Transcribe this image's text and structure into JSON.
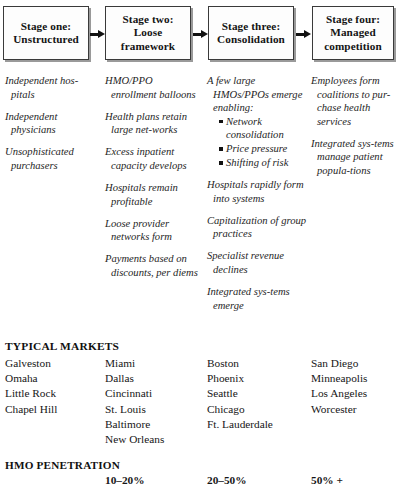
{
  "stages": [
    {
      "id": "stage-one",
      "label": "Stage one:\nUnstructured"
    },
    {
      "id": "stage-two",
      "label": "Stage two:\nLoose\nframework"
    },
    {
      "id": "stage-three",
      "label": "Stage three:\nConsolidation"
    },
    {
      "id": "stage-four",
      "label": "Stage four:\nManaged\ncompetition"
    }
  ],
  "columns": [
    {
      "id": "column-stage-one",
      "items": [
        "Independent hos-pitals",
        "Independent physicians",
        "Unsophisticated purchasers"
      ]
    },
    {
      "id": "column-stage-two",
      "items": [
        "HMO/PPO enrollment balloons",
        "Health plans retain large net-works",
        "Excess inpatient capacity develops",
        "Hospitals remain profitable",
        "Loose provider networks form",
        "Payments based on discounts, per diems"
      ]
    },
    {
      "id": "column-stage-three",
      "items": [
        "A few large HMOs/PPOs emerge enabling:",
        "Hospitals rapidly form into systems",
        "Capitalization of group practices",
        "Specialist revenue declines",
        "Integrated sys-tems emerge"
      ],
      "sub_bullets": [
        "Network consolidation",
        "Price pressure",
        "Shifting of risk"
      ]
    },
    {
      "id": "column-stage-four",
      "items": [
        "Employees form coalitions to pur-chase health services",
        "Integrated sys-tems manage patient popula-tions"
      ]
    }
  ],
  "typical_markets": {
    "heading": "TYPICAL MARKETS",
    "columns": [
      {
        "id": "markets-stage-one",
        "cities": [
          "Galveston",
          "Omaha",
          "Little Rock",
          "Chapel Hill"
        ]
      },
      {
        "id": "markets-stage-two",
        "cities": [
          "Miami",
          "Dallas",
          "Cincinnati",
          "St. Louis",
          "Baltimore",
          "New Orleans"
        ]
      },
      {
        "id": "markets-stage-three",
        "cities": [
          "Boston",
          "Phoenix",
          "Seattle",
          "Chicago",
          "Ft. Lauderdale"
        ]
      },
      {
        "id": "markets-stage-four",
        "cities": [
          "San Diego",
          "Minneapolis",
          "Los Angeles",
          "Worcester"
        ]
      }
    ]
  },
  "hmo_penetration": {
    "heading": "HMO PENETRATION",
    "values": [
      "",
      "10–20%",
      "20–50%",
      "50% +"
    ]
  },
  "arrows": [
    "arrow-stage-one-to-two",
    "arrow-stage-two-to-three",
    "arrow-stage-three-to-four"
  ]
}
